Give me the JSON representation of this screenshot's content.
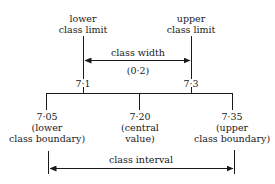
{
  "diagram": {
    "top_labels": {
      "lower_limit": [
        "lower",
        "class limit"
      ],
      "upper_limit": [
        "upper",
        "class limit"
      ]
    },
    "class_width": {
      "label": "class width",
      "value": "(0·2)"
    },
    "limits": {
      "lower": "7·1",
      "upper": "7·3"
    },
    "boundaries": [
      {
        "value": "7·05",
        "line1": "(lower",
        "line2": "class boundary)"
      },
      {
        "value": "7·20",
        "line1": "(central",
        "line2": "value)"
      },
      {
        "value": "7·35",
        "line1": "(upper",
        "line2": "class boundary)"
      }
    ],
    "class_interval": {
      "label": "class interval"
    },
    "colors": {
      "ink": "#1a1a1a",
      "background": "#ffffff"
    }
  }
}
